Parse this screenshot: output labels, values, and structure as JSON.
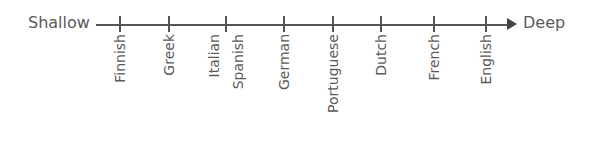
{
  "diagram": {
    "left_label": "Shallow",
    "right_label": "Deep",
    "items": [
      {
        "label": "Finnish",
        "x": 120
      },
      {
        "label": "Greek",
        "x": 169
      },
      {
        "label": "Italian",
        "x": 214
      },
      {
        "label": "Spanish",
        "x": 238
      },
      {
        "label": "German",
        "x": 284
      },
      {
        "label": "Portuguese",
        "x": 333
      },
      {
        "label": "Dutch",
        "x": 381
      },
      {
        "label": "French",
        "x": 434
      },
      {
        "label": "English",
        "x": 486
      }
    ],
    "ticks": [
      120,
      169,
      226,
      284,
      333,
      381,
      434,
      486
    ]
  }
}
